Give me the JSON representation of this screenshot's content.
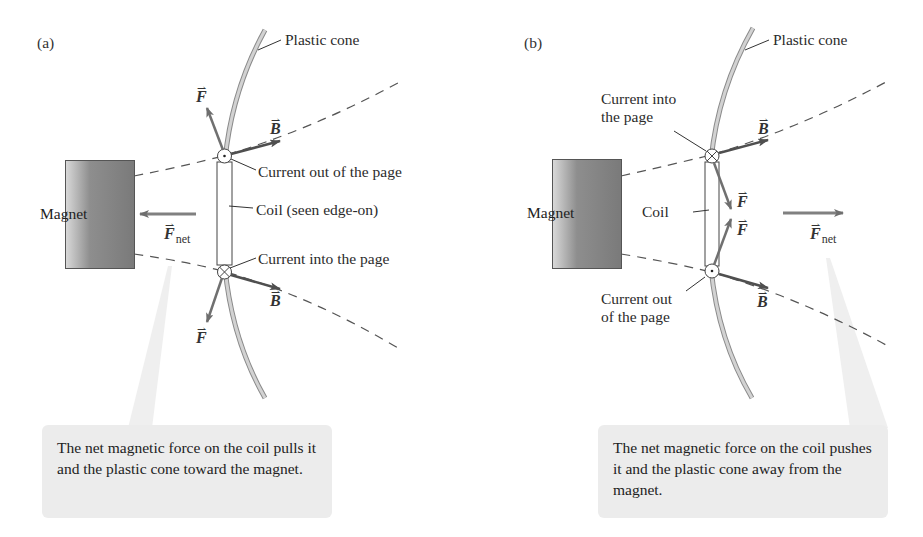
{
  "panel_a": {
    "tag": "(a)",
    "labels": {
      "plastic_cone": "Plastic cone",
      "current_out": "Current out of the page",
      "coil": "Coil (seen edge-on)",
      "current_in": "Current into the page",
      "magnet": "Magnet"
    },
    "vectors": {
      "force_top": "F",
      "field_top": "B",
      "force_bottom": "F",
      "field_bottom": "B",
      "net_force": "F",
      "net_sub": "net",
      "arrow_glyph": "⇀"
    },
    "caption": "The net magnetic force on the coil pulls it and the plastic cone toward the magnet."
  },
  "panel_b": {
    "tag": "(b)",
    "labels": {
      "plastic_cone": "Plastic cone",
      "current_in_line1": "Current into",
      "current_in_line2": "the page",
      "coil": "Coil",
      "current_out_line1": "Current out",
      "current_out_line2": "of the page",
      "magnet": "Magnet"
    },
    "vectors": {
      "field_top": "B",
      "force_upper": "F",
      "force_lower": "F",
      "field_bottom": "B",
      "net_force": "F",
      "net_sub": "net",
      "arrow_glyph": "⇀"
    },
    "caption": "The net magnetic force on the coil pushes it and the plastic cone away from the magnet."
  },
  "colors": {
    "vector": "#6e6e6e",
    "field_vector": "#555555",
    "cone_fill": "#cfcfcf",
    "callout_bg": "#ececec",
    "dashed_line": "#555555"
  }
}
